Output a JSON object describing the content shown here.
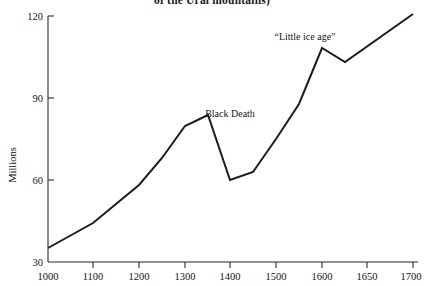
{
  "chart_data": {
    "type": "line",
    "title": "of the Ural mountains)",
    "xlabel": "",
    "ylabel": "Millions",
    "xlim": [
      1000,
      1700
    ],
    "ylim": [
      30,
      120
    ],
    "grid": false,
    "legend": "none",
    "xticks": [
      {
        "value": 1000,
        "label": "1000",
        "px": 48
      },
      {
        "value": 1100,
        "label": "1100",
        "px": 93
      },
      {
        "value": 1200,
        "label": "1200",
        "px": 139
      },
      {
        "value": 1300,
        "label": "1300",
        "px": 185
      },
      {
        "value": 1400,
        "label": "1400",
        "px": 230
      },
      {
        "value": 1500,
        "label": "1500",
        "px": 276
      },
      {
        "value": 1600,
        "label": "1600",
        "px": 322
      },
      {
        "value": 1650,
        "label": "1650",
        "px": 367
      },
      {
        "value": 1700,
        "label": "1700",
        "px": 413
      }
    ],
    "yticks": [
      {
        "value": 30,
        "label": "30",
        "px": 262
      },
      {
        "value": 60,
        "label": "60",
        "px": 180
      },
      {
        "value": 90,
        "label": "90",
        "px": 98
      },
      {
        "value": 120,
        "label": "120",
        "px": 16
      }
    ],
    "x": [
      1000,
      1100,
      1200,
      1250,
      1300,
      1350,
      1400,
      1450,
      1500,
      1550,
      1600,
      1650,
      1700
    ],
    "values": [
      35,
      44,
      58,
      68,
      80,
      85,
      60,
      63,
      75,
      88,
      110,
      105,
      120
    ],
    "series": [
      {
        "name": "European population",
        "values": [
          35,
          44,
          58,
          68,
          80,
          85,
          60,
          63,
          75,
          88,
          110,
          105,
          120
        ]
      }
    ],
    "points_px": [
      [
        48,
        248
      ],
      [
        93,
        223
      ],
      [
        139,
        185
      ],
      [
        162,
        158
      ],
      [
        185,
        126
      ],
      [
        208,
        115
      ],
      [
        230,
        180
      ],
      [
        253,
        172
      ],
      [
        276,
        139
      ],
      [
        299,
        104
      ],
      [
        322,
        48
      ],
      [
        345,
        62
      ],
      [
        413,
        14
      ]
    ],
    "annotations": [
      {
        "text": "Black Death",
        "x": 1335,
        "y": 93,
        "px_x": 230,
        "px_y": 117
      },
      {
        "text": "“Little ice age”",
        "x": 1570,
        "y": 115,
        "px_x": 305,
        "px_y": 40
      }
    ]
  }
}
